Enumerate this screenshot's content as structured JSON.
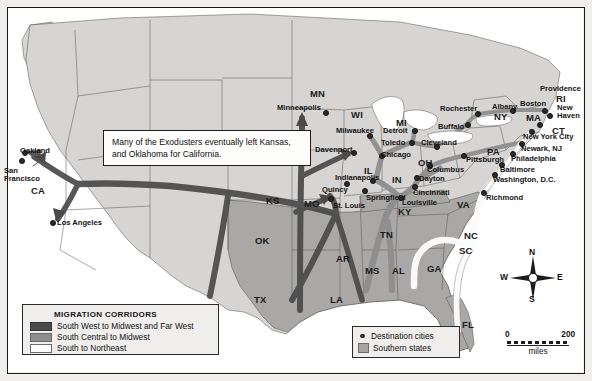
{
  "figure": {
    "type": "thematic-migration-map",
    "region": "United States",
    "callout_text": "Many of the Exodusters eventually left Kansas, and Oklahoma for California."
  },
  "legend_corridors": {
    "title": "MIGRATION CORRIDORS",
    "items": [
      {
        "label": "South West to Midwest and Far West",
        "color": "#4a4a4a"
      },
      {
        "label": "South Central to Midwest",
        "color": "#8e8e8e"
      },
      {
        "label": "South to Northeast",
        "color": "#fbfbfb"
      }
    ]
  },
  "legend_key": {
    "items": [
      {
        "label": "Destination cities",
        "symbol": "dot",
        "color": "#2b2b2b"
      },
      {
        "label": "Southern states",
        "symbol": "square",
        "color": "#a6a6a6"
      }
    ]
  },
  "compass": {
    "n": "N",
    "e": "E",
    "s": "S",
    "w": "W"
  },
  "scale": {
    "min": "0",
    "max": "200",
    "unit": "miles"
  },
  "colors": {
    "northern_states": "#d6d5d3",
    "southern_states": "#a9a8a6",
    "ocean": "#ffffff",
    "border": "#1a1a1a",
    "corridor_dark": "#4a4a4a",
    "corridor_mid": "#8e8e8e",
    "corridor_white": "#fbfbfb"
  },
  "states": [
    {
      "abbr": "CA",
      "x": 31,
      "y": 186
    },
    {
      "abbr": "KS",
      "x": 266,
      "y": 196
    },
    {
      "abbr": "OK",
      "x": 255,
      "y": 236
    },
    {
      "abbr": "TX",
      "x": 254,
      "y": 295
    },
    {
      "abbr": "LA",
      "x": 330,
      "y": 295
    },
    {
      "abbr": "AR",
      "x": 336,
      "y": 254
    },
    {
      "abbr": "MO",
      "x": 304,
      "y": 199
    },
    {
      "abbr": "IA",
      "x": 301,
      "y": 155
    },
    {
      "abbr": "MN",
      "x": 310,
      "y": 89
    },
    {
      "abbr": "WI",
      "x": 351,
      "y": 110
    },
    {
      "abbr": "IL",
      "x": 364,
      "y": 166
    },
    {
      "abbr": "MI",
      "x": 396,
      "y": 118
    },
    {
      "abbr": "IN",
      "x": 392,
      "y": 175
    },
    {
      "abbr": "OH",
      "x": 418,
      "y": 158
    },
    {
      "abbr": "KY",
      "x": 398,
      "y": 207
    },
    {
      "abbr": "TN",
      "x": 380,
      "y": 230
    },
    {
      "abbr": "MS",
      "x": 365,
      "y": 266
    },
    {
      "abbr": "AL",
      "x": 392,
      "y": 266
    },
    {
      "abbr": "GA",
      "x": 427,
      "y": 264
    },
    {
      "abbr": "FL",
      "x": 462,
      "y": 320
    },
    {
      "abbr": "SC",
      "x": 459,
      "y": 246
    },
    {
      "abbr": "NC",
      "x": 464,
      "y": 231
    },
    {
      "abbr": "VA",
      "x": 457,
      "y": 200
    },
    {
      "abbr": "PA",
      "x": 487,
      "y": 147
    },
    {
      "abbr": "NY",
      "x": 494,
      "y": 112
    },
    {
      "abbr": "MA",
      "x": 526,
      "y": 113
    },
    {
      "abbr": "RI",
      "x": 556,
      "y": 94
    },
    {
      "abbr": "CT",
      "x": 552,
      "y": 126
    }
  ],
  "cities": [
    {
      "name": "Oakland",
      "dx": 24,
      "dy": 152,
      "lx": 20,
      "ly": 147,
      "anchor": "start"
    },
    {
      "name": "San\nFrancisco",
      "dx": 21,
      "dy": 160,
      "lx": 4,
      "ly": 167,
      "anchor": "start"
    },
    {
      "name": "Los Angeles",
      "dx": 52,
      "dy": 222,
      "lx": 57,
      "ly": 219,
      "anchor": "start"
    },
    {
      "name": "Minneapolis",
      "dx": 325,
      "dy": 112,
      "lx": 277,
      "ly": 104,
      "anchor": "start"
    },
    {
      "name": "Milwaukee",
      "dx": 369,
      "dy": 135,
      "lx": 336,
      "ly": 127,
      "anchor": "start"
    },
    {
      "name": "Davenport",
      "dx": 353,
      "dy": 152,
      "lx": 315,
      "ly": 146,
      "anchor": "start"
    },
    {
      "name": "Quincy",
      "dx": 346,
      "dy": 183,
      "lx": 322,
      "ly": 186,
      "anchor": "start"
    },
    {
      "name": "St. Louis",
      "dx": 330,
      "dy": 198,
      "lx": 333,
      "ly": 202,
      "anchor": "start"
    },
    {
      "name": "Springfield",
      "dx": 364,
      "dy": 190,
      "lx": 366,
      "ly": 194,
      "anchor": "start"
    },
    {
      "name": "Indianapolis",
      "dx": 372,
      "dy": 180,
      "lx": 335,
      "ly": 174,
      "anchor": "start"
    },
    {
      "name": "Chicago",
      "dx": 381,
      "dy": 155,
      "lx": 381,
      "ly": 151,
      "anchor": "start"
    },
    {
      "name": "Toledo",
      "dx": 411,
      "dy": 142,
      "lx": 381,
      "ly": 139,
      "anchor": "start"
    },
    {
      "name": "Detroit",
      "dx": 414,
      "dy": 130,
      "lx": 383,
      "ly": 127,
      "anchor": "start"
    },
    {
      "name": "Cleveland",
      "dx": 436,
      "dy": 146,
      "lx": 421,
      "ly": 139,
      "anchor": "start"
    },
    {
      "name": "Columbus",
      "dx": 429,
      "dy": 165,
      "lx": 427,
      "ly": 166,
      "anchor": "start"
    },
    {
      "name": "Dayton",
      "dx": 416,
      "dy": 177,
      "lx": 419,
      "ly": 175,
      "anchor": "start"
    },
    {
      "name": "Cincinnati",
      "dx": 414,
      "dy": 186,
      "lx": 413,
      "ly": 189,
      "anchor": "start"
    },
    {
      "name": "Louisville",
      "dx": 400,
      "dy": 197,
      "lx": 402,
      "ly": 199,
      "anchor": "start"
    },
    {
      "name": "Buffalo",
      "dx": 467,
      "dy": 124,
      "lx": 438,
      "ly": 123,
      "anchor": "start"
    },
    {
      "name": "Rochester",
      "dx": 477,
      "dy": 113,
      "lx": 440,
      "ly": 105,
      "anchor": "start"
    },
    {
      "name": "Albany",
      "dx": 512,
      "dy": 110,
      "lx": 492,
      "ly": 103,
      "anchor": "start"
    },
    {
      "name": "Boston",
      "dx": 544,
      "dy": 110,
      "lx": 520,
      "ly": 100,
      "anchor": "start"
    },
    {
      "name": "Providence",
      "dx": 549,
      "dy": 115,
      "lx": 540,
      "ly": 85,
      "anchor": "start"
    },
    {
      "name": "New\nHaven",
      "dx": 539,
      "dy": 124,
      "lx": 557,
      "ly": 104,
      "anchor": "start"
    },
    {
      "name": "New York City",
      "dx": 531,
      "dy": 131,
      "lx": 523,
      "ly": 133,
      "anchor": "start"
    },
    {
      "name": "Newark, NJ",
      "dx": 521,
      "dy": 143,
      "lx": 521,
      "ly": 145,
      "anchor": "start"
    },
    {
      "name": "Philadelphia",
      "dx": 512,
      "dy": 153,
      "lx": 511,
      "ly": 155,
      "anchor": "start"
    },
    {
      "name": "Baltimore",
      "dx": 501,
      "dy": 164,
      "lx": 500,
      "ly": 166,
      "anchor": "start"
    },
    {
      "name": "Washington, D.C.",
      "dx": 494,
      "dy": 174,
      "lx": 493,
      "ly": 176,
      "anchor": "start"
    },
    {
      "name": "Richmond",
      "dx": 483,
      "dy": 192,
      "lx": 486,
      "ly": 194,
      "anchor": "start"
    },
    {
      "name": "Pittsburgh",
      "dx": 463,
      "dy": 155,
      "lx": 466,
      "ly": 156,
      "anchor": "start"
    }
  ]
}
